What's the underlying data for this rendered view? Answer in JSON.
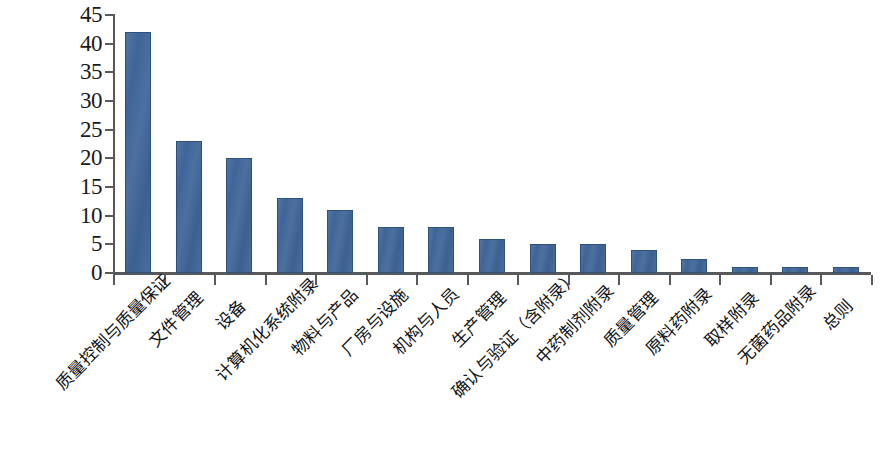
{
  "chart_data": {
    "type": "bar",
    "title": "",
    "subtitle": "",
    "xlabel": "",
    "ylabel": "",
    "ylim": [
      0,
      45
    ],
    "ytick_step": 5,
    "grid": false,
    "legend": null,
    "bar_color": "#3f6598",
    "bar_edge_color": "#2f4f7d",
    "axis_color": "#58595b",
    "categories": [
      "质量控制与质量保证",
      "文件管理",
      "设备",
      "计算机化系统附录",
      "物料与产品",
      "厂房与设施",
      "机构与人员",
      "生产管理",
      "确认与验证（含附录）",
      "中药制剂附录",
      "质量管理",
      "原料药附录",
      "取样附录",
      "无菌药品附录",
      "总则"
    ],
    "values": [
      42,
      23,
      20,
      13,
      11,
      8,
      8,
      6,
      5,
      5,
      4,
      2.5,
      1,
      1,
      1
    ],
    "ytick_labels": [
      "0",
      "5",
      "10",
      "15",
      "20",
      "25",
      "30",
      "35",
      "40",
      "45"
    ],
    "ytick_values": [
      0,
      5,
      10,
      15,
      20,
      25,
      30,
      35,
      40,
      45
    ]
  }
}
